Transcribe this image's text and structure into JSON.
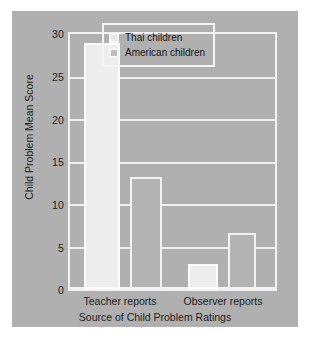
{
  "chart_data": {
    "type": "bar",
    "title": "",
    "xlabel": "Source of Child Problem Ratings",
    "ylabel": "Child Problem Mean Score",
    "categories": [
      "Teacher reports",
      "Observer reports"
    ],
    "series": [
      {
        "name": "Thai children",
        "values": [
          29.0,
          3.0
        ],
        "color": "#ededed"
      },
      {
        "name": "American children",
        "values": [
          13.2,
          6.6
        ],
        "color": "#b3b3b3"
      }
    ],
    "ylim": [
      0,
      30
    ],
    "yticks": [
      0,
      5,
      10,
      15,
      20,
      25,
      30
    ],
    "ytick_labels": [
      "0",
      "5",
      "10",
      "15",
      "20",
      "25",
      "30"
    ],
    "grid": true,
    "legend_position": "top-right",
    "background_color": "#b0b0b0",
    "gridline_color": "#f0f0f0",
    "text_color": "#1c1c1c"
  },
  "legend": {
    "items": [
      {
        "label": "Thai children",
        "swatch": "thai-swatch"
      },
      {
        "label": "American children",
        "swatch": "american-swatch"
      }
    ]
  }
}
